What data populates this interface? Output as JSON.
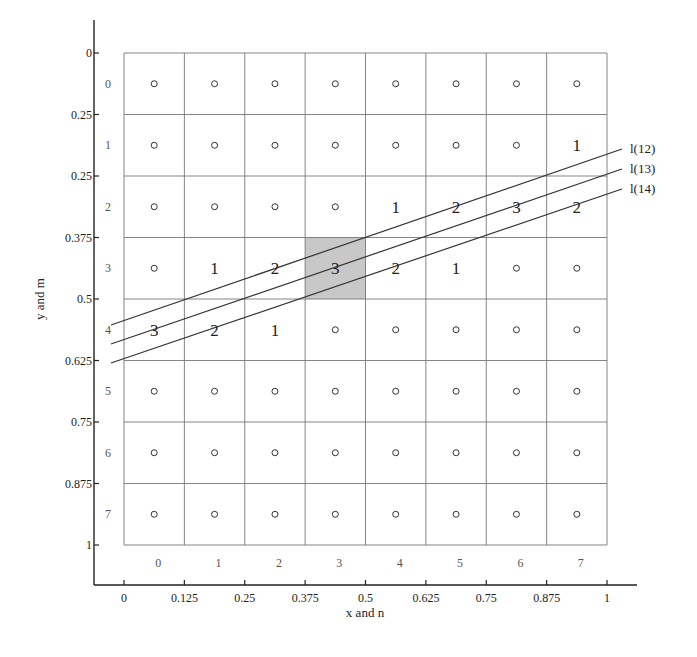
{
  "chart_data": {
    "type": "diagram",
    "title": "",
    "xlabel": "x and n",
    "ylabel": "y and m",
    "x_ticks": [
      "0",
      "0.125",
      "0.25",
      "0.375",
      "0.5",
      "0.625",
      "0.75",
      "0.875",
      "1"
    ],
    "y_ticks": [
      "0",
      "0.25",
      "0.25",
      "0.375",
      "0.5",
      "0.625",
      "0.75",
      "0.875",
      "1"
    ],
    "col_indices": [
      "0",
      "1",
      "2",
      "3",
      "4",
      "5",
      "6",
      "7"
    ],
    "row_indices": [
      "0",
      "1",
      "2",
      "3",
      "4",
      "5",
      "6",
      "7"
    ],
    "grid_size": [
      8,
      8
    ],
    "highlighted_cell": {
      "row": 3,
      "col": 3,
      "value": "3",
      "fill": "#c8c8c8"
    },
    "cell_values": [
      {
        "row": 1,
        "col": 7,
        "value": "1"
      },
      {
        "row": 2,
        "col": 4,
        "value": "1"
      },
      {
        "row": 2,
        "col": 5,
        "value": "2"
      },
      {
        "row": 2,
        "col": 6,
        "value": "3"
      },
      {
        "row": 2,
        "col": 7,
        "value": "2"
      },
      {
        "row": 3,
        "col": 1,
        "value": "1"
      },
      {
        "row": 3,
        "col": 2,
        "value": "2"
      },
      {
        "row": 3,
        "col": 3,
        "value": "3"
      },
      {
        "row": 3,
        "col": 4,
        "value": "2"
      },
      {
        "row": 3,
        "col": 5,
        "value": "1"
      },
      {
        "row": 4,
        "col": 0,
        "value": "3"
      },
      {
        "row": 4,
        "col": 1,
        "value": "2"
      },
      {
        "row": 4,
        "col": 2,
        "value": "1"
      }
    ],
    "empty_cell_marker": "o",
    "lines": [
      {
        "label": "l(12)",
        "from": [
          111,
          325
        ],
        "to": [
          622,
          149
        ]
      },
      {
        "label": "l(13)",
        "from": [
          111,
          344
        ],
        "to": [
          622,
          169
        ]
      },
      {
        "label": "l(14)",
        "from": [
          111,
          363
        ],
        "to": [
          622,
          189
        ]
      }
    ]
  }
}
